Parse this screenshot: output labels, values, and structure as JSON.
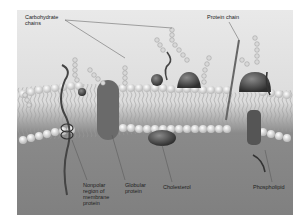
{
  "diagram": {
    "labels": {
      "carbohydrate_chains": "Carbohydrate\nchains",
      "protein_chain": "Protein chain",
      "nonpolar_region": "Nonpolar\nregion of\nmembrane\nprotein",
      "globular_protein": "Globular\nprotein",
      "cholesterol": "Cholesterol",
      "phospholipid": "Phospholipid"
    },
    "colors": {
      "background_top": "#e6e6e6",
      "background_bottom": "#808080",
      "lipid_head": "#f4f4f4",
      "protein": "#5a5a5a"
    }
  }
}
